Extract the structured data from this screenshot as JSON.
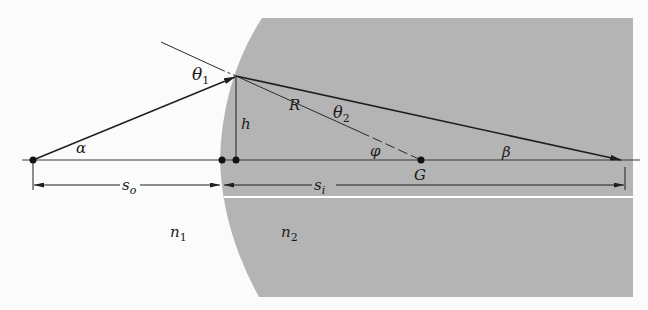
{
  "figure": {
    "colors": {
      "background": "#fbfbfb",
      "medium2": "#b4b4b4",
      "line": "#2a2a2a",
      "divider": "#ffffff"
    },
    "labels": {
      "theta1": "θ",
      "theta1_sub": "1",
      "theta2": "θ",
      "theta2_sub": "2",
      "alpha": "α",
      "beta": "β",
      "phi": "φ",
      "R": "R",
      "h": "h",
      "G": "G",
      "so": "s",
      "so_sub": "o",
      "si": "s",
      "si_sub": "i",
      "n1": "n",
      "n1_sub": "1",
      "n2": "n",
      "n2_sub": "2"
    },
    "points": {
      "object": {
        "x": 33,
        "y": 160
      },
      "vertex": {
        "x": 222,
        "y": 160
      },
      "foot_h": {
        "x": 236,
        "y": 160
      },
      "incidence": {
        "x": 236,
        "y": 76
      },
      "center_G": {
        "x": 421,
        "y": 160
      },
      "image": {
        "x": 622,
        "y": 160
      }
    }
  }
}
